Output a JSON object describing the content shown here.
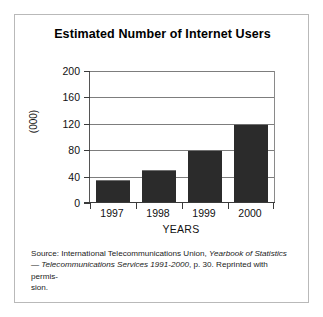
{
  "chart_data": {
    "type": "bar",
    "title": "Estimated Number of Internet Users",
    "categories": [
      "1997",
      "1998",
      "1999",
      "2000"
    ],
    "values": [
      35,
      50,
      80,
      120
    ],
    "xlabel": "YEARS",
    "ylabel": "(000)",
    "ylim": [
      0,
      200
    ],
    "yticks": [
      "0",
      "40",
      "80",
      "120",
      "160",
      "200"
    ],
    "grid": true,
    "legend": "none",
    "bar_color": "#2b2b2b",
    "frame_color": "#b9b9b9",
    "axis_color": "#3a3a3a"
  },
  "source_note": {
    "line1_a": "Source: International Telecommunications Union,  ",
    "line1_b": "Yearbook of Statistics",
    "line2_a": "— ",
    "line2_b": "Telecommunications Services 1991-2000",
    "line2_c": ", p. 30. Reprinted with permis-",
    "line3": "sion."
  }
}
